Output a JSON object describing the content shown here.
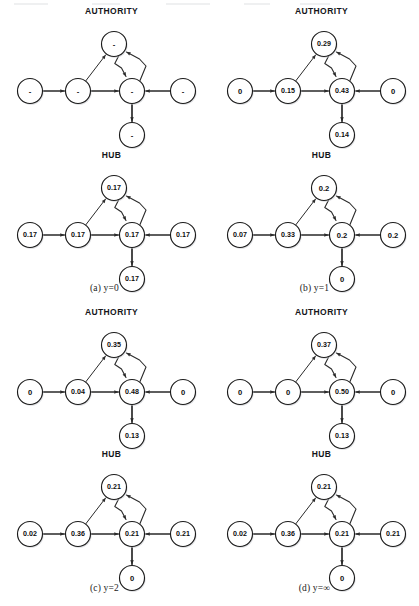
{
  "figure": {
    "type": "diagram",
    "panel_titles": {
      "authority": "AUTHORITY",
      "hub": "HUB"
    },
    "graph_structure": {
      "nodes": [
        "far_left",
        "left",
        "top",
        "center",
        "right",
        "bottom"
      ],
      "edges": [
        {
          "from": "far_left",
          "to": "left"
        },
        {
          "from": "left",
          "to": "top"
        },
        {
          "from": "left",
          "to": "center"
        },
        {
          "from": "top",
          "to": "center"
        },
        {
          "from": "center",
          "to": "top"
        },
        {
          "from": "right",
          "to": "center"
        },
        {
          "from": "center",
          "to": "bottom"
        }
      ]
    }
  },
  "panels": [
    {
      "id": "a",
      "caption_index": "(a)",
      "caption_value": "y=0",
      "authority": {
        "title": "AUTHORITY",
        "values": {
          "far_left": "-",
          "left": "-",
          "top": "-",
          "center": "-",
          "right": "-",
          "bottom": "-"
        }
      },
      "hub": {
        "title": "HUB",
        "values": {
          "far_left": "0.17",
          "left": "0.17",
          "top": "0.17",
          "center": "0.17",
          "right": "0.17",
          "bottom": "0.17"
        }
      }
    },
    {
      "id": "b",
      "caption_index": "(b)",
      "caption_value": "y=1",
      "authority": {
        "title": "AUTHORITY",
        "values": {
          "far_left": "0",
          "left": "0.15",
          "top": "0.29",
          "center": "0.43",
          "right": "0",
          "bottom": "0.14"
        }
      },
      "hub": {
        "title": "HUB",
        "values": {
          "far_left": "0.07",
          "left": "0.33",
          "top": "0.2",
          "center": "0.2",
          "right": "0.2",
          "bottom": "0"
        }
      }
    },
    {
      "id": "c",
      "caption_index": "(c)",
      "caption_value": "y=2",
      "authority": {
        "title": "AUTHORITY",
        "values": {
          "far_left": "0",
          "left": "0.04",
          "top": "0.35",
          "center": "0.48",
          "right": "0",
          "bottom": "0.13"
        }
      },
      "hub": {
        "title": "HUB",
        "values": {
          "far_left": "0.02",
          "left": "0.36",
          "top": "0.21",
          "center": "0.21",
          "right": "0.21",
          "bottom": "0"
        }
      }
    },
    {
      "id": "d",
      "caption_index": "(d)",
      "caption_value": "y=∞",
      "authority": {
        "title": "AUTHORITY",
        "values": {
          "far_left": "0",
          "left": "0",
          "top": "0.37",
          "center": "0.50",
          "right": "0",
          "bottom": "0.13"
        }
      },
      "hub": {
        "title": "HUB",
        "values": {
          "far_left": "0.02",
          "left": "0.36",
          "top": "0.21",
          "center": "0.21",
          "right": "0.21",
          "bottom": "0"
        }
      }
    }
  ],
  "colors": {
    "node_stroke": "#1b1b1b",
    "node_fill": "#ffffff",
    "edge": "#2a2a2a",
    "text": "#0d0d0d",
    "background": "#ffffff"
  }
}
